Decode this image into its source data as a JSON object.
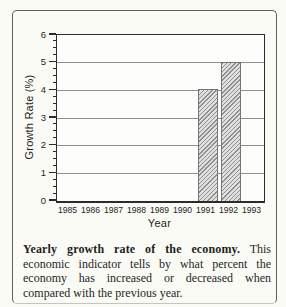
{
  "figure": {
    "caption_lead": "Yearly growth rate of the economy.",
    "caption_body": "This economic indicator tells by what percent the economy has increased or decreased when compared with the previous year."
  },
  "chart_data": {
    "type": "bar",
    "categories": [
      "1985",
      "1986",
      "1987",
      "1988",
      "1989",
      "1990",
      "1991",
      "1992",
      "1993"
    ],
    "values": [
      null,
      null,
      null,
      null,
      null,
      null,
      4,
      5,
      null
    ],
    "title": "",
    "xlabel": "Year",
    "ylabel": "Growth Rate (%)",
    "ylim": [
      0,
      6
    ],
    "yticks": [
      0,
      1,
      2,
      3,
      4,
      5,
      6
    ],
    "minor_tick_step": 0.25,
    "grid": true,
    "legend": "none",
    "bar_style": "diagonal-hatch",
    "colors": {
      "background": "#fbfbf6",
      "frame": "#5f5f5f",
      "axis": "#2c2c2c",
      "grid": "#8f8f8f",
      "text": "#1e1e1e",
      "bar_base": "#e0e0e0",
      "bar_hatch": "#8e8e8e"
    }
  }
}
